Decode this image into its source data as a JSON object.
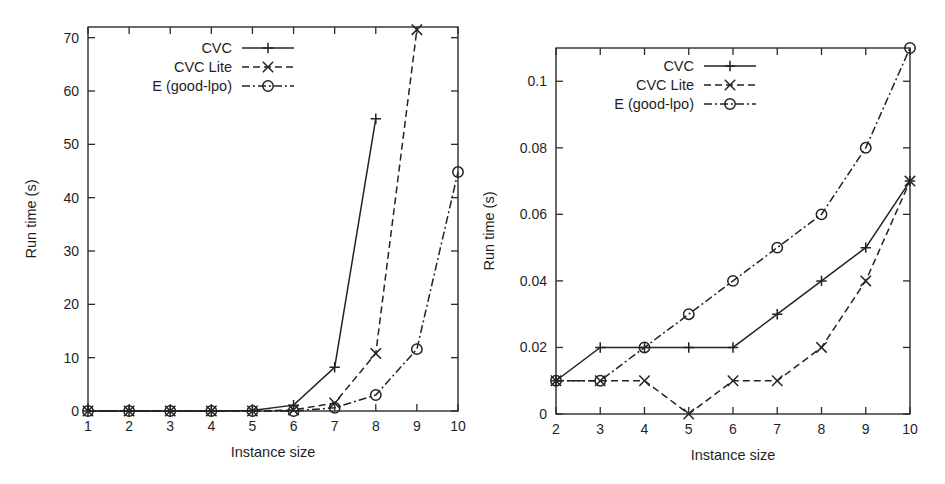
{
  "figure": {
    "panels": [
      {
        "name": "left-panel",
        "xlabel": "Instance size",
        "ylabel": "Run time (s)",
        "xticks": [
          "1",
          "2",
          "3",
          "4",
          "5",
          "6",
          "7",
          "8",
          "9",
          "10"
        ],
        "yticks": [
          "0",
          "10",
          "20",
          "30",
          "40",
          "50",
          "60",
          "70"
        ],
        "legend": [
          {
            "label": "CVC",
            "marker": "plus",
            "dash": "solid"
          },
          {
            "label": "CVC Lite",
            "marker": "cross",
            "dash": "dashed"
          },
          {
            "label": "E (good-lpo)",
            "marker": "circle",
            "dash": "dashdot"
          }
        ]
      },
      {
        "name": "right-panel",
        "xlabel": "Instance size",
        "ylabel": "Run time (s)",
        "xticks": [
          "2",
          "3",
          "4",
          "5",
          "6",
          "7",
          "8",
          "9",
          "10"
        ],
        "yticks": [
          "0",
          "0.02",
          "0.04",
          "0.06",
          "0.08",
          "0.1"
        ],
        "legend": [
          {
            "label": "CVC",
            "marker": "plus",
            "dash": "solid"
          },
          {
            "label": "CVC Lite",
            "marker": "cross",
            "dash": "dashed"
          },
          {
            "label": "E (good-lpo)",
            "marker": "circle",
            "dash": "dashdot"
          }
        ]
      }
    ]
  },
  "chart_data": [
    {
      "type": "line",
      "name": "left-panel",
      "title": "",
      "xlabel": "Instance size",
      "ylabel": "Run time (s)",
      "xlim": [
        1,
        10
      ],
      "ylim": [
        0,
        72
      ],
      "xticks": [
        1,
        2,
        3,
        4,
        5,
        6,
        7,
        8,
        9,
        10
      ],
      "yticks": [
        0,
        10,
        20,
        30,
        40,
        50,
        60,
        70
      ],
      "grid": false,
      "legend_position": "top-center",
      "x": [
        1,
        2,
        3,
        4,
        5,
        6,
        7,
        8,
        9,
        10
      ],
      "series": [
        {
          "name": "CVC",
          "marker": "plus",
          "dash": "solid",
          "x": [
            1,
            2,
            3,
            4,
            5,
            6,
            7,
            8
          ],
          "values": [
            0,
            0,
            0,
            0,
            0.1,
            1.1,
            8.2,
            54.8
          ]
        },
        {
          "name": "CVC Lite",
          "marker": "cross",
          "dash": "dashed",
          "x": [
            1,
            2,
            3,
            4,
            5,
            6,
            7,
            8,
            9
          ],
          "values": [
            0,
            0,
            0,
            0,
            0,
            0.2,
            1.5,
            10.8,
            71.5
          ]
        },
        {
          "name": "E (good-lpo)",
          "marker": "circle",
          "dash": "dashdot",
          "x": [
            1,
            2,
            3,
            4,
            5,
            6,
            7,
            8,
            9,
            10
          ],
          "values": [
            0,
            0,
            0,
            0,
            0,
            0,
            0.6,
            3.0,
            11.6,
            44.8
          ]
        }
      ]
    },
    {
      "type": "line",
      "name": "right-panel",
      "title": "",
      "xlabel": "Instance size",
      "ylabel": "Run time (s)",
      "xlim": [
        2,
        10
      ],
      "ylim": [
        0,
        0.11
      ],
      "xticks": [
        2,
        3,
        4,
        5,
        6,
        7,
        8,
        9,
        10
      ],
      "yticks": [
        0,
        0.02,
        0.04,
        0.06,
        0.08,
        0.1
      ],
      "grid": false,
      "legend_position": "top-center",
      "x": [
        2,
        3,
        4,
        5,
        6,
        7,
        8,
        9,
        10
      ],
      "series": [
        {
          "name": "CVC",
          "marker": "plus",
          "dash": "solid",
          "x": [
            2,
            3,
            4,
            5,
            6,
            7,
            8,
            9,
            10
          ],
          "values": [
            0.01,
            0.02,
            0.02,
            0.02,
            0.02,
            0.03,
            0.04,
            0.05,
            0.07
          ]
        },
        {
          "name": "CVC Lite",
          "marker": "cross",
          "dash": "dashed",
          "x": [
            2,
            3,
            4,
            5,
            6,
            7,
            8,
            9,
            10
          ],
          "values": [
            0.01,
            0.01,
            0.01,
            0.0,
            0.01,
            0.01,
            0.02,
            0.04,
            0.07
          ]
        },
        {
          "name": "E (good-lpo)",
          "marker": "circle",
          "dash": "dashdot",
          "x": [
            2,
            3,
            4,
            5,
            6,
            7,
            8,
            9,
            10
          ],
          "values": [
            0.01,
            0.01,
            0.02,
            0.03,
            0.04,
            0.05,
            0.06,
            0.08,
            0.11
          ]
        }
      ]
    }
  ]
}
